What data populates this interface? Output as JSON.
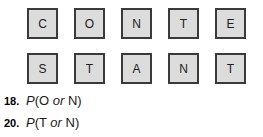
{
  "worksheet": {
    "tile_rows": [
      {
        "letters": [
          "C",
          "O",
          "N",
          "T",
          "E"
        ]
      },
      {
        "letters": [
          "S",
          "T",
          "A",
          "N",
          "T"
        ]
      }
    ],
    "word": "CONTESTANT",
    "exercises": [
      {
        "number": "18.",
        "function": "P",
        "open_paren": "(",
        "first_outcome": "O",
        "connector": "or",
        "second_outcome": "N",
        "close_paren": ")",
        "full_text": "P(O or N)"
      },
      {
        "number": "20.",
        "function": "P",
        "open_paren": "(",
        "first_outcome": "T",
        "connector": "or",
        "second_outcome": "N",
        "close_paren": ")",
        "full_text": "P(T or N)"
      }
    ],
    "colors": {
      "tile_fill": "#dcdcdc",
      "tile_border": "#3a3a3a",
      "text": "#1a1a1a",
      "background": "#ffffff"
    }
  }
}
